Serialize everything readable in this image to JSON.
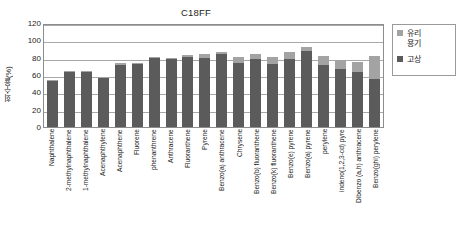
{
  "chart_data": {
    "type": "bar",
    "subtype": "stacked-column",
    "title": "C18FF",
    "xlabel": "",
    "ylabel": "회수율(%)",
    "ylim": [
      0,
      120
    ],
    "yticks": [
      0,
      20,
      40,
      60,
      80,
      100,
      120
    ],
    "grid": true,
    "legend_position": "right",
    "categories": [
      "Naphthalene",
      "2-methylnaphthalene",
      "1-methylnaphthalene",
      "Acenaphthylene",
      "Acenaphthene",
      "Fluorene",
      "phenanthrene",
      "Anthracene",
      "Fluoranthene",
      "Pyrene",
      "Benzo(a) anthracene",
      "Chrysene",
      "Benzo(b) fluoranthene",
      "Benzo(k) fluoranthene",
      "Benzo(e) pyrene",
      "Benzo(a) pyrene",
      "perylene",
      "indeno(1,2,3-cd) pyre",
      "Dibenzo (a,h) anthracene",
      "Benzo(ghi) perylene"
    ],
    "series": [
      {
        "name": "고상",
        "color": "#5b5b5b",
        "values": [
          53,
          64,
          64,
          57,
          72,
          73,
          80,
          78,
          81,
          80,
          84,
          74,
          78,
          73,
          79,
          88,
          71,
          67,
          64,
          55
        ]
      },
      {
        "name": "유리 용기",
        "color": "#a3a3a3",
        "values": [
          1,
          1,
          1,
          1,
          2,
          1,
          1,
          2,
          2,
          4,
          3,
          7,
          6,
          8,
          7,
          4,
          11,
          10,
          11,
          27
        ]
      }
    ],
    "totals": [
      54,
      65,
      65,
      58,
      74,
      74,
      81,
      80,
      83,
      84,
      87,
      81,
      84,
      81,
      86,
      92,
      82,
      77,
      75,
      82
    ]
  },
  "legend": {
    "items": [
      {
        "label": "유리\n용기",
        "color": "#a3a3a3"
      },
      {
        "label": "고상",
        "color": "#5b5b5b"
      }
    ]
  },
  "axis": {
    "y_title": "회수율(%)",
    "tick_labels": [
      "120",
      "100",
      "80",
      "60",
      "40",
      "20",
      "0"
    ]
  }
}
